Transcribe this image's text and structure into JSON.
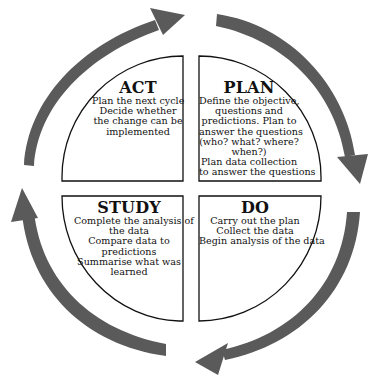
{
  "diagram": {
    "type": "PDSA cycle",
    "colors": {
      "arrow_fill": "#5a5a5a",
      "quadrant_border": "#111111",
      "quadrant_fill": "#ffffff",
      "text": "#111111",
      "background": "#ffffff"
    },
    "quadrants": {
      "act": {
        "title": "ACT",
        "lines": [
          "Plan the next cycle",
          "Decide whether",
          "the change can be",
          "implemented"
        ]
      },
      "plan": {
        "title": "PLAN",
        "lines": [
          "Define the objective,",
          "questions and",
          "predictions. Plan to",
          "answer the questions",
          "(who? what? where?",
          "when?)",
          "Plan data collection",
          "to answer the questions"
        ]
      },
      "study": {
        "title": "STUDY",
        "lines": [
          "Complete the analysis of",
          "the data",
          "Compare data to",
          "predictions",
          "Summarise what was",
          "learned"
        ]
      },
      "do": {
        "title": "DO",
        "lines": [
          "Carry out the plan",
          "Collect the data",
          "Begin analysis of the data"
        ]
      }
    },
    "arrows": [
      {
        "name": "act-to-plan",
        "direction": "clockwise",
        "position": "top-left"
      },
      {
        "name": "plan-to-do",
        "direction": "clockwise",
        "position": "top-right"
      },
      {
        "name": "do-to-study",
        "direction": "clockwise",
        "position": "bottom-right"
      },
      {
        "name": "study-to-act",
        "direction": "clockwise",
        "position": "bottom-left"
      }
    ]
  }
}
